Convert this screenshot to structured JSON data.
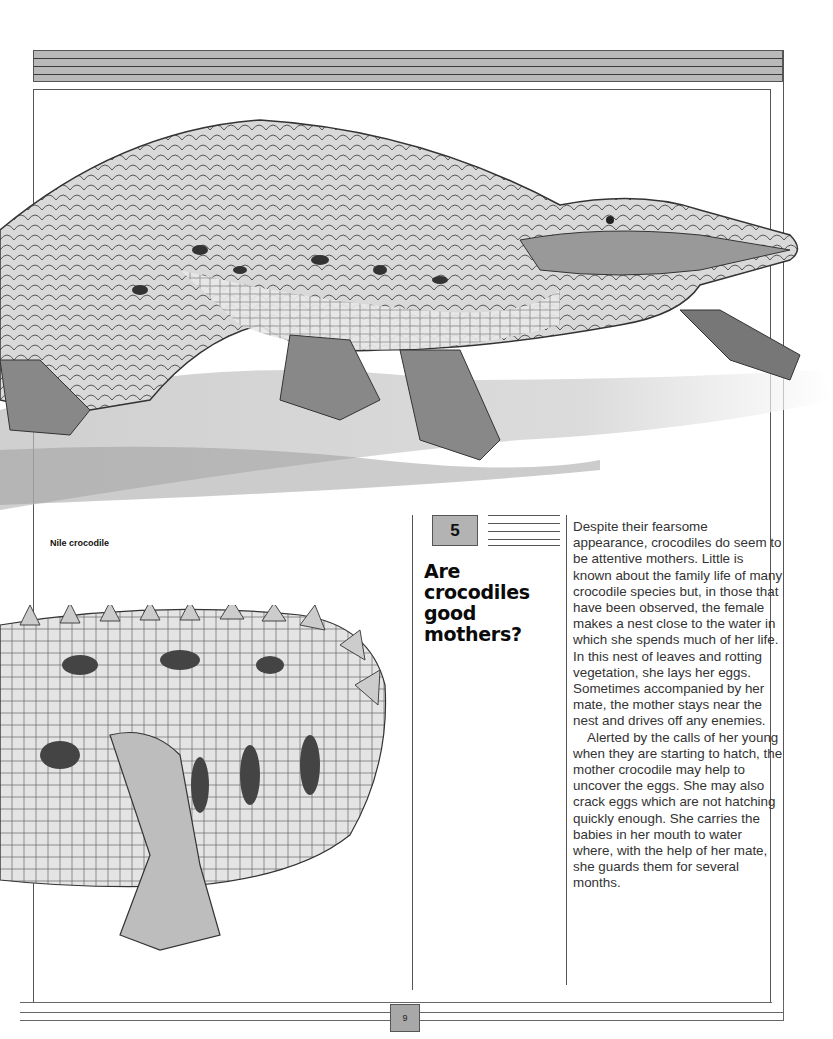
{
  "page": {
    "number": "9",
    "section_number": "5",
    "heading": "Are crocodiles good mothers?",
    "heading_lines": [
      "Are",
      "crocodiles",
      "good",
      "mothers?"
    ],
    "illustration_caption": "Nile crocodile",
    "illustrations": [
      {
        "subject": "Nile crocodile walking with prey in jaws",
        "icon": "crocodile-illustration"
      },
      {
        "subject": "Crocodile tail and hind leg close-up",
        "icon": "crocodile-tail-illustration"
      }
    ],
    "body_paragraphs": [
      "Despite their fearsome appearance, crocodiles do seem to be attentive mothers. Little is known about the family life of many crocodile species but, in those that have been observed, the female makes a nest close to the water in which she spends much of her life. In this nest of leaves and rotting vegetation, she lays her eggs. Sometimes accompanied by her mate, the mother stays near the nest and drives off any enemies.",
      "Alerted by the calls of her young when they are starting to hatch, the mother crocodile may help to uncover the eggs. She may also crack eggs which are not hatching quickly enough. She carries the babies in her mouth to water where, with the help of her mate, she guards them for several months."
    ]
  },
  "colors": {
    "banner": "#b9b9b9",
    "number_box": "#b3b3b3",
    "rule": "#555555",
    "text": "#333333"
  }
}
